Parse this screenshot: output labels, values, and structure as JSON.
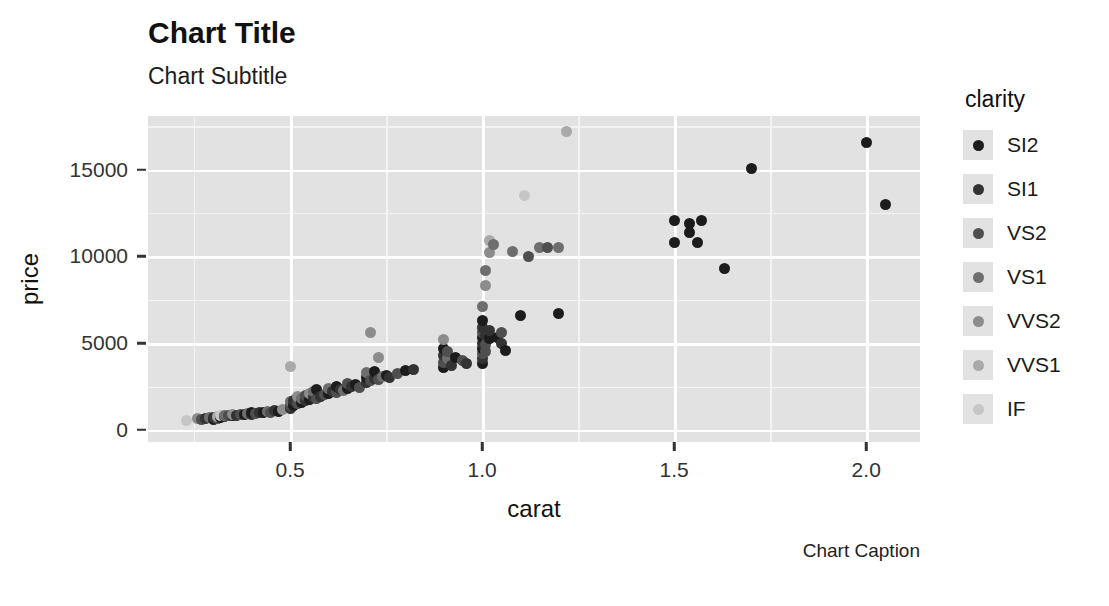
{
  "chart_data": {
    "type": "scatter",
    "title": "Chart Title",
    "subtitle": "Chart Subtitle",
    "caption": "Chart Caption",
    "xlabel": "carat",
    "ylabel": "price",
    "xlim": [
      0.13,
      2.14
    ],
    "ylim": [
      -700,
      18100
    ],
    "xticks": [
      0.5,
      1.0,
      1.5,
      2.0
    ],
    "xtick_labels": [
      "0.5",
      "1.0",
      "1.5",
      "2.0"
    ],
    "yticks": [
      0,
      5000,
      10000,
      15000
    ],
    "ytick_labels": [
      "0",
      "5000",
      "10000",
      "15000"
    ],
    "grid": true,
    "legend": {
      "title": "clarity",
      "position": "right",
      "entries": [
        {
          "label": "SI2",
          "color": "#1c1c1c"
        },
        {
          "label": "SI1",
          "color": "#333333"
        },
        {
          "label": "VS2",
          "color": "#4f4f4f"
        },
        {
          "label": "VS1",
          "color": "#6e6e6e"
        },
        {
          "label": "VVS2",
          "color": "#8c8c8c"
        },
        {
          "label": "VVS1",
          "color": "#a9a9a9"
        },
        {
          "label": "IF",
          "color": "#c6c6c6"
        }
      ]
    },
    "color_by": "clarity",
    "points": [
      {
        "x": 0.23,
        "y": 560,
        "c": "#c6c6c6"
      },
      {
        "x": 0.26,
        "y": 680,
        "c": "#8c8c8c"
      },
      {
        "x": 0.27,
        "y": 600,
        "c": "#4f4f4f"
      },
      {
        "x": 0.28,
        "y": 640,
        "c": "#333333"
      },
      {
        "x": 0.29,
        "y": 700,
        "c": "#6e6e6e"
      },
      {
        "x": 0.3,
        "y": 620,
        "c": "#1c1c1c"
      },
      {
        "x": 0.3,
        "y": 700,
        "c": "#333333"
      },
      {
        "x": 0.31,
        "y": 680,
        "c": "#4f4f4f"
      },
      {
        "x": 0.31,
        "y": 760,
        "c": "#a9a9a9"
      },
      {
        "x": 0.32,
        "y": 720,
        "c": "#1c1c1c"
      },
      {
        "x": 0.32,
        "y": 800,
        "c": "#c6c6c6"
      },
      {
        "x": 0.33,
        "y": 760,
        "c": "#333333"
      },
      {
        "x": 0.33,
        "y": 850,
        "c": "#6e6e6e"
      },
      {
        "x": 0.34,
        "y": 800,
        "c": "#4f4f4f"
      },
      {
        "x": 0.35,
        "y": 840,
        "c": "#1c1c1c"
      },
      {
        "x": 0.35,
        "y": 900,
        "c": "#8c8c8c"
      },
      {
        "x": 0.36,
        "y": 820,
        "c": "#333333"
      },
      {
        "x": 0.37,
        "y": 880,
        "c": "#4f4f4f"
      },
      {
        "x": 0.38,
        "y": 860,
        "c": "#1c1c1c"
      },
      {
        "x": 0.39,
        "y": 940,
        "c": "#6e6e6e"
      },
      {
        "x": 0.4,
        "y": 900,
        "c": "#333333"
      },
      {
        "x": 0.4,
        "y": 980,
        "c": "#1c1c1c"
      },
      {
        "x": 0.41,
        "y": 940,
        "c": "#4f4f4f"
      },
      {
        "x": 0.42,
        "y": 1000,
        "c": "#333333"
      },
      {
        "x": 0.43,
        "y": 980,
        "c": "#1c1c1c"
      },
      {
        "x": 0.44,
        "y": 1050,
        "c": "#6e6e6e"
      },
      {
        "x": 0.45,
        "y": 1020,
        "c": "#4f4f4f"
      },
      {
        "x": 0.46,
        "y": 1100,
        "c": "#333333"
      },
      {
        "x": 0.47,
        "y": 1060,
        "c": "#1c1c1c"
      },
      {
        "x": 0.48,
        "y": 1150,
        "c": "#8c8c8c"
      },
      {
        "x": 0.5,
        "y": 1250,
        "c": "#333333"
      },
      {
        "x": 0.5,
        "y": 1420,
        "c": "#4f4f4f"
      },
      {
        "x": 0.5,
        "y": 1650,
        "c": "#6e6e6e"
      },
      {
        "x": 0.51,
        "y": 1380,
        "c": "#1c1c1c"
      },
      {
        "x": 0.51,
        "y": 1720,
        "c": "#333333"
      },
      {
        "x": 0.52,
        "y": 1500,
        "c": "#4f4f4f"
      },
      {
        "x": 0.52,
        "y": 1900,
        "c": "#8c8c8c"
      },
      {
        "x": 0.53,
        "y": 1600,
        "c": "#1c1c1c"
      },
      {
        "x": 0.53,
        "y": 1820,
        "c": "#6e6e6e"
      },
      {
        "x": 0.54,
        "y": 1700,
        "c": "#333333"
      },
      {
        "x": 0.54,
        "y": 2000,
        "c": "#4f4f4f"
      },
      {
        "x": 0.55,
        "y": 1750,
        "c": "#1c1c1c"
      },
      {
        "x": 0.55,
        "y": 2100,
        "c": "#8c8c8c"
      },
      {
        "x": 0.56,
        "y": 1850,
        "c": "#333333"
      },
      {
        "x": 0.56,
        "y": 2200,
        "c": "#6e6e6e"
      },
      {
        "x": 0.57,
        "y": 1800,
        "c": "#4f4f4f"
      },
      {
        "x": 0.57,
        "y": 2300,
        "c": "#1c1c1c"
      },
      {
        "x": 0.58,
        "y": 1950,
        "c": "#333333"
      },
      {
        "x": 0.59,
        "y": 2050,
        "c": "#4f4f4f"
      },
      {
        "x": 0.5,
        "y": 3650,
        "c": "#a9a9a9"
      },
      {
        "x": 0.6,
        "y": 2100,
        "c": "#1c1c1c"
      },
      {
        "x": 0.6,
        "y": 2400,
        "c": "#6e6e6e"
      },
      {
        "x": 0.61,
        "y": 2200,
        "c": "#333333"
      },
      {
        "x": 0.62,
        "y": 2150,
        "c": "#4f4f4f"
      },
      {
        "x": 0.62,
        "y": 2500,
        "c": "#1c1c1c"
      },
      {
        "x": 0.63,
        "y": 2300,
        "c": "#333333"
      },
      {
        "x": 0.64,
        "y": 2250,
        "c": "#6e6e6e"
      },
      {
        "x": 0.65,
        "y": 2400,
        "c": "#1c1c1c"
      },
      {
        "x": 0.65,
        "y": 2700,
        "c": "#4f4f4f"
      },
      {
        "x": 0.66,
        "y": 2500,
        "c": "#333333"
      },
      {
        "x": 0.67,
        "y": 2600,
        "c": "#1c1c1c"
      },
      {
        "x": 0.68,
        "y": 2450,
        "c": "#4f4f4f"
      },
      {
        "x": 0.7,
        "y": 2750,
        "c": "#333333"
      },
      {
        "x": 0.7,
        "y": 3000,
        "c": "#1c1c1c"
      },
      {
        "x": 0.7,
        "y": 3300,
        "c": "#6e6e6e"
      },
      {
        "x": 0.71,
        "y": 2850,
        "c": "#4f4f4f"
      },
      {
        "x": 0.71,
        "y": 5600,
        "c": "#8c8c8c"
      },
      {
        "x": 0.72,
        "y": 2950,
        "c": "#333333"
      },
      {
        "x": 0.72,
        "y": 3350,
        "c": "#1c1c1c"
      },
      {
        "x": 0.73,
        "y": 2900,
        "c": "#4f4f4f"
      },
      {
        "x": 0.73,
        "y": 4200,
        "c": "#8c8c8c"
      },
      {
        "x": 0.74,
        "y": 3050,
        "c": "#6e6e6e"
      },
      {
        "x": 0.75,
        "y": 3150,
        "c": "#1c1c1c"
      },
      {
        "x": 0.76,
        "y": 3000,
        "c": "#333333"
      },
      {
        "x": 0.78,
        "y": 3250,
        "c": "#4f4f4f"
      },
      {
        "x": 0.8,
        "y": 3400,
        "c": "#1c1c1c"
      },
      {
        "x": 0.82,
        "y": 3500,
        "c": "#333333"
      },
      {
        "x": 0.9,
        "y": 3600,
        "c": "#1c1c1c"
      },
      {
        "x": 0.9,
        "y": 3900,
        "c": "#4f4f4f"
      },
      {
        "x": 0.9,
        "y": 4300,
        "c": "#333333"
      },
      {
        "x": 0.9,
        "y": 4700,
        "c": "#1c1c1c"
      },
      {
        "x": 0.91,
        "y": 4100,
        "c": "#6e6e6e"
      },
      {
        "x": 0.91,
        "y": 4500,
        "c": "#4f4f4f"
      },
      {
        "x": 0.9,
        "y": 5200,
        "c": "#8c8c8c"
      },
      {
        "x": 0.92,
        "y": 3700,
        "c": "#333333"
      },
      {
        "x": 0.93,
        "y": 4200,
        "c": "#1c1c1c"
      },
      {
        "x": 0.95,
        "y": 4000,
        "c": "#4f4f4f"
      },
      {
        "x": 0.96,
        "y": 3850,
        "c": "#333333"
      },
      {
        "x": 1.0,
        "y": 3800,
        "c": "#1c1c1c"
      },
      {
        "x": 1.0,
        "y": 4100,
        "c": "#333333"
      },
      {
        "x": 1.0,
        "y": 4400,
        "c": "#4f4f4f"
      },
      {
        "x": 1.0,
        "y": 4700,
        "c": "#1c1c1c"
      },
      {
        "x": 1.0,
        "y": 5000,
        "c": "#333333"
      },
      {
        "x": 1.0,
        "y": 5300,
        "c": "#1c1c1c"
      },
      {
        "x": 1.0,
        "y": 5600,
        "c": "#4f4f4f"
      },
      {
        "x": 1.0,
        "y": 5900,
        "c": "#333333"
      },
      {
        "x": 1.0,
        "y": 6300,
        "c": "#1c1c1c"
      },
      {
        "x": 1.01,
        "y": 4500,
        "c": "#4f4f4f"
      },
      {
        "x": 1.01,
        "y": 5100,
        "c": "#1c1c1c"
      },
      {
        "x": 1.01,
        "y": 5450,
        "c": "#333333"
      },
      {
        "x": 1.01,
        "y": 4900,
        "c": "#4f4f4f"
      },
      {
        "x": 1.02,
        "y": 5250,
        "c": "#1c1c1c"
      },
      {
        "x": 1.02,
        "y": 5750,
        "c": "#333333"
      },
      {
        "x": 1.0,
        "y": 7100,
        "c": "#6e6e6e"
      },
      {
        "x": 1.01,
        "y": 8300,
        "c": "#8c8c8c"
      },
      {
        "x": 1.01,
        "y": 9200,
        "c": "#6e6e6e"
      },
      {
        "x": 1.02,
        "y": 10200,
        "c": "#8c8c8c"
      },
      {
        "x": 1.02,
        "y": 10900,
        "c": "#a9a9a9"
      },
      {
        "x": 1.03,
        "y": 10700,
        "c": "#6e6e6e"
      },
      {
        "x": 1.04,
        "y": 5300,
        "c": "#1c1c1c"
      },
      {
        "x": 1.05,
        "y": 5000,
        "c": "#333333"
      },
      {
        "x": 1.05,
        "y": 5600,
        "c": "#4f4f4f"
      },
      {
        "x": 1.06,
        "y": 4600,
        "c": "#1c1c1c"
      },
      {
        "x": 1.08,
        "y": 10300,
        "c": "#6e6e6e"
      },
      {
        "x": 1.1,
        "y": 6600,
        "c": "#1c1c1c"
      },
      {
        "x": 1.11,
        "y": 13500,
        "c": "#c6c6c6"
      },
      {
        "x": 1.12,
        "y": 10000,
        "c": "#4f4f4f"
      },
      {
        "x": 1.15,
        "y": 10500,
        "c": "#6e6e6e"
      },
      {
        "x": 1.17,
        "y": 10500,
        "c": "#4f4f4f"
      },
      {
        "x": 1.2,
        "y": 10500,
        "c": "#6e6e6e"
      },
      {
        "x": 1.2,
        "y": 6700,
        "c": "#1c1c1c"
      },
      {
        "x": 1.22,
        "y": 17200,
        "c": "#a9a9a9"
      },
      {
        "x": 1.5,
        "y": 10800,
        "c": "#1c1c1c"
      },
      {
        "x": 1.5,
        "y": 12100,
        "c": "#1c1c1c"
      },
      {
        "x": 1.54,
        "y": 11400,
        "c": "#1c1c1c"
      },
      {
        "x": 1.54,
        "y": 11900,
        "c": "#1c1c1c"
      },
      {
        "x": 1.56,
        "y": 10800,
        "c": "#1c1c1c"
      },
      {
        "x": 1.57,
        "y": 12100,
        "c": "#1c1c1c"
      },
      {
        "x": 1.63,
        "y": 9300,
        "c": "#1c1c1c"
      },
      {
        "x": 1.7,
        "y": 15100,
        "c": "#1c1c1c"
      },
      {
        "x": 2.0,
        "y": 16600,
        "c": "#1c1c1c"
      },
      {
        "x": 2.05,
        "y": 13000,
        "c": "#1c1c1c"
      }
    ]
  },
  "theme": {
    "panel_background": "#e2e2e2",
    "gridline_major": "#ffffff",
    "gridline_minor": "#f3f3f3",
    "text_color": "#1a1a1a",
    "page_background": "#ffffff"
  }
}
